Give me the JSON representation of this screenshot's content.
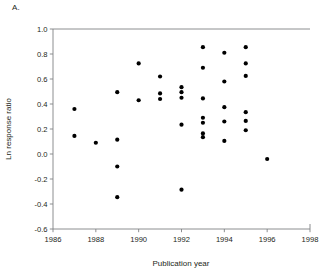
{
  "panel": {
    "label": "A."
  },
  "chart_data": {
    "type": "scatter",
    "title": "",
    "xlabel": "Publication year",
    "ylabel": "Ln response ratio",
    "xlim": [
      1986,
      1998
    ],
    "ylim": [
      -0.6,
      1.0
    ],
    "xticks": [
      1986,
      1988,
      1990,
      1992,
      1994,
      1996,
      1998
    ],
    "xtick_labels": [
      "1986",
      "1988",
      "1990",
      "1992",
      "1994",
      "1996",
      "1998"
    ],
    "yticks": [
      -0.6,
      -0.4,
      -0.2,
      0.0,
      0.2,
      0.4,
      0.6,
      0.8,
      1.0
    ],
    "ytick_labels": [
      "-0.6",
      "-0.4",
      "-0.2",
      "0.0",
      "0.2",
      "0.4",
      "0.6",
      "0.8",
      "1.0"
    ],
    "grid": false,
    "legend": false,
    "marker": "filled-circle",
    "marker_color": "#000000",
    "marker_size_px": 4.2,
    "series": [
      {
        "name": "Studies",
        "x": [
          1987,
          1987,
          1988,
          1989,
          1989,
          1989,
          1989,
          1990,
          1990,
          1991,
          1991,
          1991,
          1992,
          1992,
          1992,
          1992,
          1992,
          1993,
          1993,
          1993,
          1993,
          1993,
          1993,
          1993,
          1994,
          1994,
          1994,
          1994,
          1994,
          1995,
          1995,
          1995,
          1995,
          1995,
          1995,
          1996
        ],
        "y": [
          0.36,
          0.145,
          0.09,
          0.495,
          0.115,
          -0.1,
          -0.345,
          0.725,
          0.43,
          0.62,
          0.485,
          0.44,
          0.535,
          0.495,
          0.45,
          0.235,
          -0.285,
          0.855,
          0.69,
          0.445,
          0.29,
          0.25,
          0.165,
          0.135,
          0.81,
          0.58,
          0.375,
          0.26,
          0.105,
          0.855,
          0.725,
          0.625,
          0.335,
          0.265,
          0.19,
          -0.04
        ]
      }
    ]
  }
}
